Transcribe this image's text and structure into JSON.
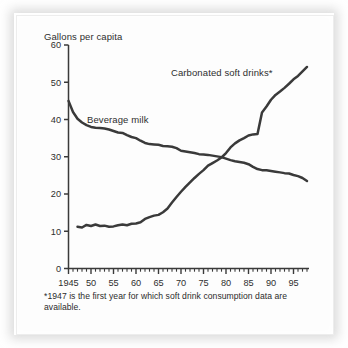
{
  "figure": {
    "background_color": "#fdfdfd",
    "ink_color": "#3a3a3a"
  },
  "axis": {
    "y_title": "Gallons per capita",
    "y_ticks": [
      "0",
      "10",
      "20",
      "30",
      "40",
      "50",
      "60"
    ],
    "x_ticks": [
      "1945",
      "50",
      "55",
      "60",
      "65",
      "70",
      "75",
      "80",
      "85",
      "90",
      "95"
    ]
  },
  "labels": {
    "soft_drinks": "Carbonated soft drinks*",
    "milk": "Beverage milk"
  },
  "footnote": {
    "text": "*1947 is the first year for which soft drink consumption data are available."
  },
  "chart_data": {
    "type": "line",
    "title": "",
    "subtitle": "",
    "xlabel": "",
    "ylabel": "Gallons per capita",
    "xlim": [
      1945,
      1998
    ],
    "ylim": [
      0,
      60
    ],
    "grid": false,
    "legend_position": "inline-annotation",
    "x_tick_values": [
      1945,
      1950,
      1955,
      1960,
      1965,
      1970,
      1975,
      1980,
      1985,
      1990,
      1995
    ],
    "x_tick_labels": [
      "1945",
      "50",
      "55",
      "60",
      "65",
      "70",
      "75",
      "80",
      "85",
      "90",
      "95"
    ],
    "y_tick_values": [
      0,
      10,
      20,
      30,
      40,
      50,
      60
    ],
    "minor_x_ticks_every": 1,
    "annotations": [
      "Carbonated soft drinks*",
      "Beverage milk"
    ],
    "series": [
      {
        "name": "Beverage milk",
        "color": "#3a3a3a",
        "x": [
          1945,
          1946,
          1947,
          1948,
          1949,
          1950,
          1951,
          1952,
          1953,
          1954,
          1955,
          1956,
          1957,
          1958,
          1959,
          1960,
          1961,
          1962,
          1963,
          1964,
          1965,
          1966,
          1967,
          1968,
          1969,
          1970,
          1971,
          1972,
          1973,
          1974,
          1975,
          1976,
          1977,
          1978,
          1979,
          1980,
          1981,
          1982,
          1983,
          1984,
          1985,
          1986,
          1987,
          1988,
          1989,
          1990,
          1991,
          1992,
          1993,
          1994,
          1995,
          1996,
          1997,
          1998
        ],
        "values": [
          45.0,
          42.0,
          40.2,
          39.2,
          38.5,
          38.0,
          37.8,
          37.7,
          37.6,
          37.3,
          36.9,
          36.5,
          36.4,
          35.8,
          35.3,
          35.0,
          34.3,
          33.7,
          33.4,
          33.3,
          33.2,
          32.9,
          32.8,
          32.7,
          32.3,
          31.6,
          31.4,
          31.2,
          31.0,
          30.7,
          30.6,
          30.5,
          30.3,
          30.1,
          29.9,
          29.5,
          29.1,
          28.8,
          28.6,
          28.4,
          28.0,
          27.3,
          26.7,
          26.4,
          26.4,
          26.2,
          26.0,
          25.8,
          25.6,
          25.5,
          25.1,
          24.8,
          24.3,
          23.5
        ]
      },
      {
        "name": "Carbonated soft drinks",
        "color": "#3a3a3a",
        "x": [
          1947,
          1948,
          1949,
          1950,
          1951,
          1952,
          1953,
          1954,
          1955,
          1956,
          1957,
          1958,
          1959,
          1960,
          1961,
          1962,
          1963,
          1964,
          1965,
          1966,
          1967,
          1968,
          1969,
          1970,
          1971,
          1972,
          1973,
          1974,
          1975,
          1976,
          1977,
          1978,
          1979,
          1980,
          1981,
          1982,
          1983,
          1984,
          1985,
          1986,
          1987,
          1988,
          1989,
          1990,
          1991,
          1992,
          1993,
          1994,
          1995,
          1996,
          1997,
          1998
        ],
        "values": [
          11.2,
          11.0,
          11.7,
          11.4,
          11.8,
          11.4,
          11.5,
          11.2,
          11.3,
          11.6,
          11.8,
          11.6,
          12.0,
          12.1,
          12.4,
          13.3,
          13.8,
          14.2,
          14.4,
          15.1,
          16.1,
          17.7,
          19.2,
          20.6,
          21.9,
          23.1,
          24.3,
          25.4,
          26.4,
          27.6,
          28.3,
          29.0,
          29.8,
          31.0,
          32.5,
          33.6,
          34.4,
          35.0,
          35.7,
          36.0,
          36.1,
          41.9,
          43.5,
          45.3,
          46.6,
          47.5,
          48.5,
          49.6,
          50.8,
          51.7,
          52.9,
          54.1
        ]
      }
    ]
  }
}
